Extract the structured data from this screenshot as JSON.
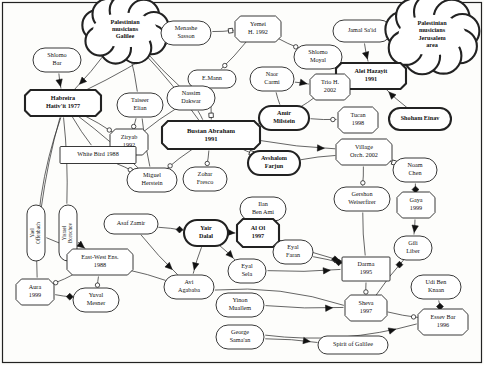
{
  "diagram": {
    "frame_color": "#222222",
    "background": "#fdfdfb",
    "node_fill": "#ffffff",
    "node_stroke": "#222222",
    "edge_stroke": "#333333"
  },
  "nodes": [
    {
      "id": "pal_galilee",
      "label": "Palestinian\nmusicians\nGalilee",
      "shape": "cloud",
      "bold": true,
      "x": 125,
      "y": 30,
      "w": 78,
      "h": 48
    },
    {
      "id": "shlomo_bar",
      "label": "Shlomo\nBar",
      "shape": "rounded",
      "bold": false,
      "x": 57,
      "y": 60,
      "w": 48,
      "h": 24
    },
    {
      "id": "habreira",
      "label": "Habreira\nHativ'it 1977",
      "shape": "octagon",
      "bold": true,
      "x": 63,
      "y": 103,
      "w": 76,
      "h": 26
    },
    {
      "id": "menashe",
      "label": "Menashe\nSasson",
      "shape": "rounded",
      "bold": false,
      "x": 186,
      "y": 33,
      "w": 50,
      "h": 24
    },
    {
      "id": "yemei",
      "label": "Yemei\nH. 1992",
      "shape": "octagon",
      "bold": false,
      "x": 258,
      "y": 29,
      "w": 46,
      "h": 26
    },
    {
      "id": "shlomo_moyal",
      "label": "Shlomo\nMoyal",
      "shape": "rounded",
      "bold": false,
      "x": 318,
      "y": 57,
      "w": 48,
      "h": 24
    },
    {
      "id": "jamal",
      "label": "Jamal Sa'id",
      "shape": "rounded",
      "bold": false,
      "x": 362,
      "y": 31,
      "w": 58,
      "h": 22
    },
    {
      "id": "pal_jerusalem",
      "label": "Palestinian\nmusicians\nJerusalem\narea",
      "shape": "cloud",
      "bold": true,
      "x": 432,
      "y": 35,
      "w": 82,
      "h": 56
    },
    {
      "id": "alei",
      "label": "Alei Hazayit\n1991",
      "shape": "octagon",
      "bold": true,
      "x": 371,
      "y": 76,
      "w": 70,
      "h": 26
    },
    {
      "id": "emann",
      "label": "E.Mann",
      "shape": "rounded",
      "bold": false,
      "x": 212,
      "y": 79,
      "w": 48,
      "h": 18
    },
    {
      "id": "naor",
      "label": "Naor\nCarmi",
      "shape": "rounded",
      "bold": false,
      "x": 272,
      "y": 79,
      "w": 44,
      "h": 24
    },
    {
      "id": "trio_h",
      "label": "Trio H.\n2002",
      "shape": "octagon",
      "bold": false,
      "x": 330,
      "y": 87,
      "w": 40,
      "h": 26
    },
    {
      "id": "taiseer",
      "label": "Taiseer\nElian",
      "shape": "rounded",
      "bold": false,
      "x": 140,
      "y": 105,
      "w": 46,
      "h": 24
    },
    {
      "id": "nassim",
      "label": "Nassim\nDakwar",
      "shape": "rounded",
      "bold": false,
      "x": 191,
      "y": 98,
      "w": 48,
      "h": 24
    },
    {
      "id": "amir",
      "label": "Amir\nMilstein",
      "shape": "rounded",
      "bold": true,
      "x": 284,
      "y": 118,
      "w": 50,
      "h": 24
    },
    {
      "id": "tucan",
      "label": "Tucan\n1998",
      "shape": "octagon",
      "bold": false,
      "x": 358,
      "y": 120,
      "w": 40,
      "h": 26
    },
    {
      "id": "shoham",
      "label": "Shoham Einav",
      "shape": "rounded",
      "bold": true,
      "x": 420,
      "y": 119,
      "w": 62,
      "h": 22
    },
    {
      "id": "bustan",
      "label": "Bustan Abraham\n1991",
      "shape": "octagon",
      "bold": true,
      "x": 211,
      "y": 135,
      "w": 98,
      "h": 28
    },
    {
      "id": "ziryab",
      "label": "Ziryab\n1992",
      "shape": "octagon",
      "bold": false,
      "x": 129,
      "y": 142,
      "w": 38,
      "h": 26
    },
    {
      "id": "white_bird",
      "label": "White Bird 1988",
      "shape": "rect",
      "bold": false,
      "x": 98,
      "y": 155,
      "w": 76,
      "h": 17
    },
    {
      "id": "avshalom",
      "label": "Avshalom\nFarjun",
      "shape": "rounded",
      "bold": true,
      "x": 274,
      "y": 163,
      "w": 52,
      "h": 24
    },
    {
      "id": "village",
      "label": "Village\nOrch. 2002",
      "shape": "octagon",
      "bold": false,
      "x": 364,
      "y": 152,
      "w": 56,
      "h": 26
    },
    {
      "id": "noam",
      "label": "Noam\nChen",
      "shape": "rounded",
      "bold": false,
      "x": 415,
      "y": 170,
      "w": 44,
      "h": 24
    },
    {
      "id": "miguel",
      "label": "Miguel\nHerstein",
      "shape": "rounded",
      "bold": false,
      "x": 152,
      "y": 180,
      "w": 50,
      "h": 24
    },
    {
      "id": "zohar",
      "label": "Zohar\nFresco",
      "shape": "rounded",
      "bold": false,
      "x": 205,
      "y": 179,
      "w": 44,
      "h": 24
    },
    {
      "id": "gershon",
      "label": "Gershon\nWeiserfirer",
      "shape": "rounded",
      "bold": false,
      "x": 362,
      "y": 199,
      "w": 56,
      "h": 24
    },
    {
      "id": "gaya",
      "label": "Gaya\n1999",
      "shape": "octagon",
      "bold": false,
      "x": 416,
      "y": 205,
      "w": 38,
      "h": 26
    },
    {
      "id": "yael",
      "label": "Yael\nOffenbach",
      "shape": "rounded-vert",
      "bold": false,
      "x": 36,
      "y": 233,
      "w": 18,
      "h": 56
    },
    {
      "id": "yisrael",
      "label": "Yisrael\nBorochov",
      "shape": "rounded-vert",
      "bold": false,
      "x": 68,
      "y": 233,
      "w": 18,
      "h": 56
    },
    {
      "id": "ilan",
      "label": "Ilan\nBen Ami",
      "shape": "rounded",
      "bold": false,
      "x": 263,
      "y": 209,
      "w": 46,
      "h": 24
    },
    {
      "id": "asaf",
      "label": "Asaf Zamir",
      "shape": "rounded",
      "bold": false,
      "x": 131,
      "y": 224,
      "w": 54,
      "h": 20
    },
    {
      "id": "yair",
      "label": "Yair\nDalal",
      "shape": "rounded",
      "bold": true,
      "x": 206,
      "y": 233,
      "w": 44,
      "h": 26
    },
    {
      "id": "alol",
      "label": "Al Ol\n1997",
      "shape": "octagon",
      "bold": true,
      "x": 258,
      "y": 233,
      "w": 42,
      "h": 28
    },
    {
      "id": "eyal_faran",
      "label": "Eyal\nFaran",
      "shape": "rounded",
      "bold": false,
      "x": 293,
      "y": 252,
      "w": 40,
      "h": 24
    },
    {
      "id": "gili",
      "label": "Gili\nLiber",
      "shape": "rounded",
      "bold": false,
      "x": 413,
      "y": 248,
      "w": 38,
      "h": 24
    },
    {
      "id": "darma",
      "label": "Darma\n1995",
      "shape": "rect",
      "bold": false,
      "x": 366,
      "y": 269,
      "w": 48,
      "h": 24
    },
    {
      "id": "eastwest",
      "label": "East-West Ens.\n1988",
      "shape": "octagon",
      "bold": false,
      "x": 100,
      "y": 262,
      "w": 66,
      "h": 26
    },
    {
      "id": "eyal_sela",
      "label": "Eyal\nSela",
      "shape": "rounded",
      "bold": false,
      "x": 247,
      "y": 271,
      "w": 38,
      "h": 24
    },
    {
      "id": "avi",
      "label": "Avi\nAgababa",
      "shape": "rounded",
      "bold": false,
      "x": 189,
      "y": 287,
      "w": 50,
      "h": 24
    },
    {
      "id": "udi",
      "label": "Udi Ben\nKnaan",
      "shape": "rounded",
      "bold": false,
      "x": 436,
      "y": 287,
      "w": 50,
      "h": 24
    },
    {
      "id": "aura",
      "label": "Aura\n1999",
      "shape": "octagon",
      "bold": false,
      "x": 35,
      "y": 292,
      "w": 38,
      "h": 26
    },
    {
      "id": "yuval",
      "label": "Yuval\nMesner",
      "shape": "rounded",
      "bold": false,
      "x": 96,
      "y": 300,
      "w": 46,
      "h": 24
    },
    {
      "id": "sheva",
      "label": "Sheva\n1997",
      "shape": "octagon",
      "bold": false,
      "x": 366,
      "y": 308,
      "w": 42,
      "h": 26
    },
    {
      "id": "essev",
      "label": "Essev Bar\n1996",
      "shape": "octagon",
      "bold": false,
      "x": 443,
      "y": 322,
      "w": 50,
      "h": 26
    },
    {
      "id": "yinon",
      "label": "Yinon\nMuallem",
      "shape": "rounded",
      "bold": false,
      "x": 240,
      "y": 305,
      "w": 48,
      "h": 24
    },
    {
      "id": "george",
      "label": "George\nSama'an",
      "shape": "rounded",
      "bold": false,
      "x": 240,
      "y": 337,
      "w": 48,
      "h": 24
    },
    {
      "id": "spirit",
      "label": "Spirit of Galilee",
      "shape": "rounded",
      "bold": false,
      "x": 353,
      "y": 345,
      "w": 70,
      "h": 18
    }
  ],
  "edges": [
    {
      "from": "pal_galilee",
      "to": "habreira",
      "marker": "arrow"
    },
    {
      "from": "shlomo_bar",
      "to": "habreira",
      "marker": "arrow"
    },
    {
      "from": "pal_galilee",
      "to": "taiseer",
      "marker": "none"
    },
    {
      "from": "pal_galilee",
      "to": "nassim",
      "marker": "none"
    },
    {
      "from": "pal_galilee",
      "to": "bustan",
      "marker": "none"
    },
    {
      "from": "menashe",
      "to": "yemei",
      "marker": "square"
    },
    {
      "from": "menashe",
      "to": "habreira",
      "marker": "none"
    },
    {
      "from": "yemei",
      "to": "shlomo_moyal",
      "marker": "circle"
    },
    {
      "from": "yemei",
      "to": "emann",
      "marker": "circle"
    },
    {
      "from": "jamal",
      "to": "alei",
      "marker": "arrow"
    },
    {
      "from": "pal_jerusalem",
      "to": "jamal",
      "marker": "none"
    },
    {
      "from": "shlomo_moyal",
      "to": "alei",
      "marker": "circle"
    },
    {
      "from": "naor",
      "to": "trio_h",
      "marker": "arrow"
    },
    {
      "from": "naor",
      "to": "amir",
      "marker": "none"
    },
    {
      "from": "trio_h",
      "to": "amir",
      "marker": "none"
    },
    {
      "from": "amir",
      "to": "tucan",
      "marker": "circle"
    },
    {
      "from": "shoham",
      "to": "alei",
      "marker": "arrow"
    },
    {
      "from": "emann",
      "to": "bustan",
      "marker": "square"
    },
    {
      "from": "taiseer",
      "to": "ziryab",
      "marker": "circle"
    },
    {
      "from": "taiseer",
      "to": "miguel",
      "marker": "none"
    },
    {
      "from": "nassim",
      "to": "bustan",
      "marker": "none"
    },
    {
      "from": "nassim",
      "to": "ziryab",
      "marker": "none"
    },
    {
      "from": "habreira",
      "to": "ziryab",
      "marker": "circle"
    },
    {
      "from": "habreira",
      "to": "white_bird",
      "marker": "none"
    },
    {
      "from": "habreira",
      "to": "miguel",
      "marker": "none"
    },
    {
      "from": "habreira",
      "to": "yael",
      "marker": "none"
    },
    {
      "from": "habreira",
      "to": "yisrael",
      "marker": "none"
    },
    {
      "from": "habreira",
      "to": "aura",
      "marker": "none"
    },
    {
      "from": "white_bird",
      "to": "miguel",
      "marker": "circle"
    },
    {
      "from": "bustan",
      "to": "miguel",
      "marker": "circle"
    },
    {
      "from": "bustan",
      "to": "zohar",
      "marker": "circle"
    },
    {
      "from": "bustan",
      "to": "avshalom",
      "marker": "square"
    },
    {
      "from": "bustan",
      "to": "amir",
      "marker": "none"
    },
    {
      "from": "bustan",
      "to": "village",
      "marker": "arrow"
    },
    {
      "from": "avshalom",
      "to": "village",
      "marker": "none"
    },
    {
      "from": "village",
      "to": "noam",
      "marker": "square"
    },
    {
      "from": "village",
      "to": "gershon",
      "marker": "circle"
    },
    {
      "from": "noam",
      "to": "gaya",
      "marker": "dot"
    },
    {
      "from": "gaya",
      "to": "gili",
      "marker": "arrow"
    },
    {
      "from": "gershon",
      "to": "darma",
      "marker": "none"
    },
    {
      "from": "yael",
      "to": "eastwest",
      "marker": "none"
    },
    {
      "from": "yisrael",
      "to": "eastwest",
      "marker": "arrow"
    },
    {
      "from": "asaf",
      "to": "yair",
      "marker": "dot"
    },
    {
      "from": "asaf",
      "to": "avi",
      "marker": "arrow"
    },
    {
      "from": "yair",
      "to": "alol",
      "marker": "arrow"
    },
    {
      "from": "yair",
      "to": "avi",
      "marker": "arrow"
    },
    {
      "from": "yair",
      "to": "eyal_sela",
      "marker": "arrow"
    },
    {
      "from": "ilan",
      "to": "alol",
      "marker": "none"
    },
    {
      "from": "alol",
      "to": "eyal_faran",
      "marker": "square"
    },
    {
      "from": "alol",
      "to": "darma",
      "marker": "dot"
    },
    {
      "from": "eyal_faran",
      "to": "darma",
      "marker": "dot"
    },
    {
      "from": "eyal_sela",
      "to": "darma",
      "marker": "arrow"
    },
    {
      "from": "eastwest",
      "to": "aura",
      "marker": "circle"
    },
    {
      "from": "eastwest",
      "to": "yuval",
      "marker": "circle"
    },
    {
      "from": "eastwest",
      "to": "avi",
      "marker": "none"
    },
    {
      "from": "aura",
      "to": "yuval",
      "marker": "dot"
    },
    {
      "from": "avi",
      "to": "sheva",
      "marker": "none"
    },
    {
      "from": "yinon",
      "to": "sheva",
      "marker": "arrow"
    },
    {
      "from": "george",
      "to": "spirit",
      "marker": "arrow"
    },
    {
      "from": "george",
      "to": "essev",
      "marker": "arrow"
    },
    {
      "from": "sheva",
      "to": "gili",
      "marker": "dot"
    },
    {
      "from": "sheva",
      "to": "essev",
      "marker": "circle"
    },
    {
      "from": "udi",
      "to": "essev",
      "marker": "dot"
    },
    {
      "from": "darma",
      "to": "sheva",
      "marker": "circle"
    }
  ]
}
